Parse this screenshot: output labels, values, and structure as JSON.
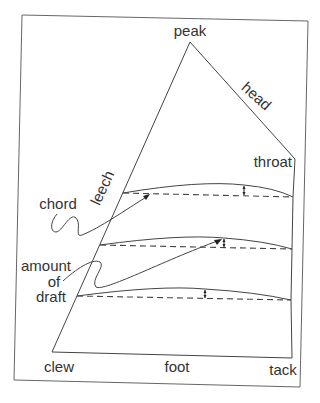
{
  "diagram": {
    "type": "sail-anatomy",
    "labels": {
      "peak": "peak",
      "head": "head",
      "throat": "throat",
      "leech": "leech",
      "chord": "chord",
      "amount": "amount",
      "of": "of",
      "draft": "draft",
      "clew": "clew",
      "foot": "foot",
      "tack": "tack"
    },
    "colors": {
      "line": "#555555",
      "text": "#333333",
      "background": "#ffffff"
    },
    "chords": [
      {
        "name": "upper",
        "start_y": 193,
        "draft_x": 244
      },
      {
        "name": "middle",
        "start_y": 245,
        "draft_x": 224
      },
      {
        "name": "lower",
        "start_y": 296,
        "draft_x": 205
      }
    ]
  }
}
